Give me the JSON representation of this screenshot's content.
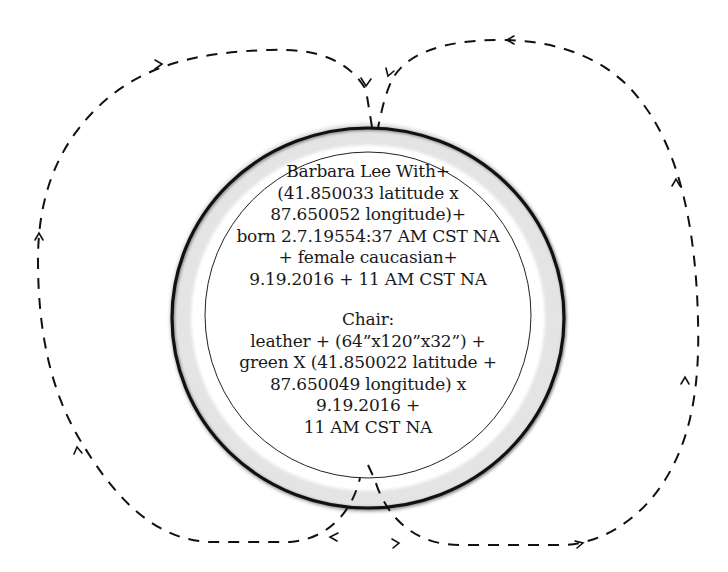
{
  "diagram": {
    "colors": {
      "background": "#ffffff",
      "stroke": "#111111",
      "ring_fill": "#e6e6e6",
      "text": "#1a1a1a"
    },
    "person": {
      "lines": [
        "Barbara Lee With+",
        "(41.850033 latitude x",
        "87.650052 longitude)+",
        "born 2.7.19554:37 AM CST NA",
        "+ female caucasian+",
        "9.19.2016 + 11 AM CST NA"
      ]
    },
    "chair": {
      "lines": [
        "Chair:",
        "leather + (64”x120”x32”) +",
        "green X (41.850022 latitude +",
        "87.650049 longitude) x",
        "9.19.2016 +",
        "11 AM CST NA"
      ]
    },
    "loops": [
      {
        "name": "left-loop",
        "direction": "counterclockwise",
        "arrow_count": 4
      },
      {
        "name": "right-loop",
        "direction": "clockwise",
        "arrow_count": 4
      }
    ]
  }
}
